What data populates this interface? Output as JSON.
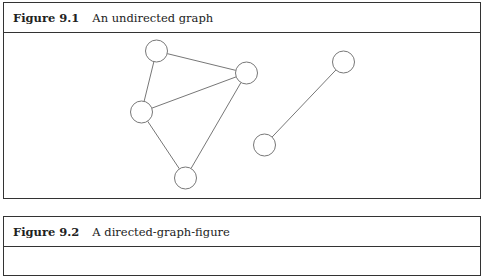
{
  "figures": [
    {
      "label": "Figure 9.1",
      "caption": "An undirected graph",
      "graph": {
        "type": "undirected",
        "nodes": [
          {
            "id": "A",
            "x": 157,
            "y": 51
          },
          {
            "id": "B",
            "x": 247,
            "y": 73
          },
          {
            "id": "C",
            "x": 142,
            "y": 112
          },
          {
            "id": "D",
            "x": 186,
            "y": 178
          },
          {
            "id": "E",
            "x": 344,
            "y": 62
          },
          {
            "id": "F",
            "x": 265,
            "y": 145
          }
        ],
        "edges": [
          [
            "A",
            "B"
          ],
          [
            "A",
            "C"
          ],
          [
            "C",
            "B"
          ],
          [
            "C",
            "D"
          ],
          [
            "B",
            "D"
          ],
          [
            "E",
            "F"
          ]
        ]
      }
    },
    {
      "label": "Figure 9.2",
      "caption": "A directed-graph-figure"
    }
  ]
}
